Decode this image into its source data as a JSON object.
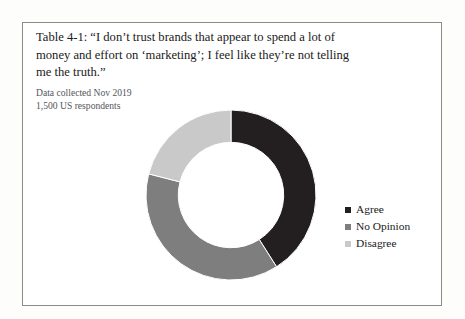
{
  "figure": {
    "title_lines": [
      "Table 4-1: “I don’t trust brands that appear to spend a lot of",
      "money and effort on ‘marketing’; I feel like they’re not telling",
      "me the truth.”"
    ],
    "subtitle_lines": [
      "Data collected Nov 2019",
      "1,500 US respondents"
    ]
  },
  "chart_data": {
    "type": "pie",
    "variant": "donut",
    "title": "Table 4-1: “I don’t trust brands that appear to spend a lot of money and effort on ‘marketing’; I feel like they’re not telling me the truth.”",
    "subtitle": "Data collected Nov 2019 — 1,500 US respondents",
    "categories": [
      "Agree",
      "No Opinion",
      "Disagree"
    ],
    "values": [
      41,
      38,
      21
    ],
    "unit": "percent",
    "colors": [
      "#231f20",
      "#7e7e7e",
      "#c9c9c9"
    ],
    "start_angle_deg": 0,
    "direction": "clockwise",
    "inner_radius_ratio": 0.62,
    "legend": {
      "position": "right",
      "entries": [
        {
          "label": "Agree",
          "color": "#231f20"
        },
        {
          "label": "No Opinion",
          "color": "#7e7e7e"
        },
        {
          "label": "Disagree",
          "color": "#c9c9c9"
        }
      ]
    },
    "grid": false,
    "xlabel": "",
    "ylabel": ""
  }
}
